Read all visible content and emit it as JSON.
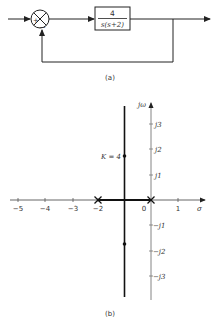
{
  "block_diagram": {
    "summing_junction": {
      "plus_sign": "+",
      "minus_sign": "−"
    },
    "transfer_function": {
      "numerator": "4",
      "denominator": "s(s+2)"
    },
    "caption": "(a)"
  },
  "root_locus": {
    "y_axis_label": "jω",
    "x_axis_label": "σ",
    "x_ticks": [
      "−5",
      "−4",
      "−3",
      "−2",
      "0",
      "1"
    ],
    "y_ticks_positive": [
      "j3",
      "j2",
      "j1"
    ],
    "y_ticks_negative": [
      "−j1",
      "−j2",
      "−j3"
    ],
    "gain_annotation": "K = 4",
    "caption": "(b)",
    "open_loop_poles": [
      0,
      -2
    ],
    "closed_loop_poles_K4": [
      "-1 + j1.73",
      "-1 - j1.73"
    ]
  }
}
